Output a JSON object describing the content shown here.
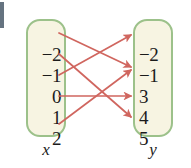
{
  "diagram": {
    "type": "mapping-diagram",
    "title": "",
    "domain_label": "x",
    "range_label": "y",
    "domain_set": {
      "label": "x",
      "elements": [
        "−2",
        "−1",
        "0",
        "1",
        "2"
      ]
    },
    "range_set": {
      "label": "y",
      "elements": [
        "−2",
        "−1",
        "3",
        "4",
        "5"
      ]
    },
    "mappings": [
      {
        "from": "−2",
        "to": "3"
      },
      {
        "from": "−1",
        "to": "5"
      },
      {
        "from": "0",
        "to": "−2"
      },
      {
        "from": "1",
        "to": "4"
      },
      {
        "from": "2",
        "to": "3"
      }
    ],
    "colors": {
      "box_fill": "#f7f4e2",
      "box_border": "#9cc18a",
      "arrow": "#d0665f",
      "text": "#1b1b1b",
      "background": "#ffffff"
    }
  }
}
